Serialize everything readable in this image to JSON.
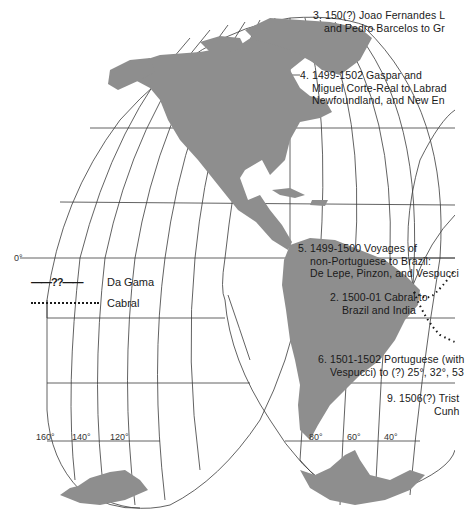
{
  "map": {
    "title": "Early Portuguese and other voyages (partial view)",
    "projection": "interrupted homolosine",
    "colors": {
      "land": "#8e8e8e",
      "grid": "#3a3a3a",
      "route": "#1a1a1a",
      "background": "#ffffff"
    }
  },
  "legend": {
    "items": [
      {
        "symbol": "——??——",
        "label": "Da Gama",
        "style": "dashed"
      },
      {
        "symbol": "...................",
        "label": "Cabral",
        "style": "dotted"
      }
    ]
  },
  "annotations": [
    {
      "id": "3",
      "lines": [
        "3. 150(?) Joao Fernandes L",
        "and Pedro Barcelos to Gr"
      ]
    },
    {
      "id": "4",
      "lines": [
        "4. 1499-1502 Gaspar and",
        "Miguel Corte-Real to Labrad",
        "Newfoundland, and New En"
      ]
    },
    {
      "id": "5",
      "lines": [
        "5. 1499-1500 Voyages of",
        "non-Portuguese to Brazil:",
        "De Lepe, Pinzon, and Vespucci"
      ]
    },
    {
      "id": "2",
      "lines": [
        "2. 1500-01 Cabral to",
        "Brazil and India"
      ]
    },
    {
      "id": "6",
      "lines": [
        "6. 1501-1502 Portuguese (with",
        "Vespucci) to (?) 25°, 32°, 53"
      ]
    },
    {
      "id": "9",
      "lines": [
        "9. 1506(?) Trist",
        "Cunh"
      ]
    }
  ],
  "degree_labels": {
    "equator": "0°",
    "longitudes_west_lobe": [
      "160°",
      "140°",
      "120°"
    ],
    "longitudes_south_america": [
      "80°",
      "60°",
      "40°"
    ]
  }
}
